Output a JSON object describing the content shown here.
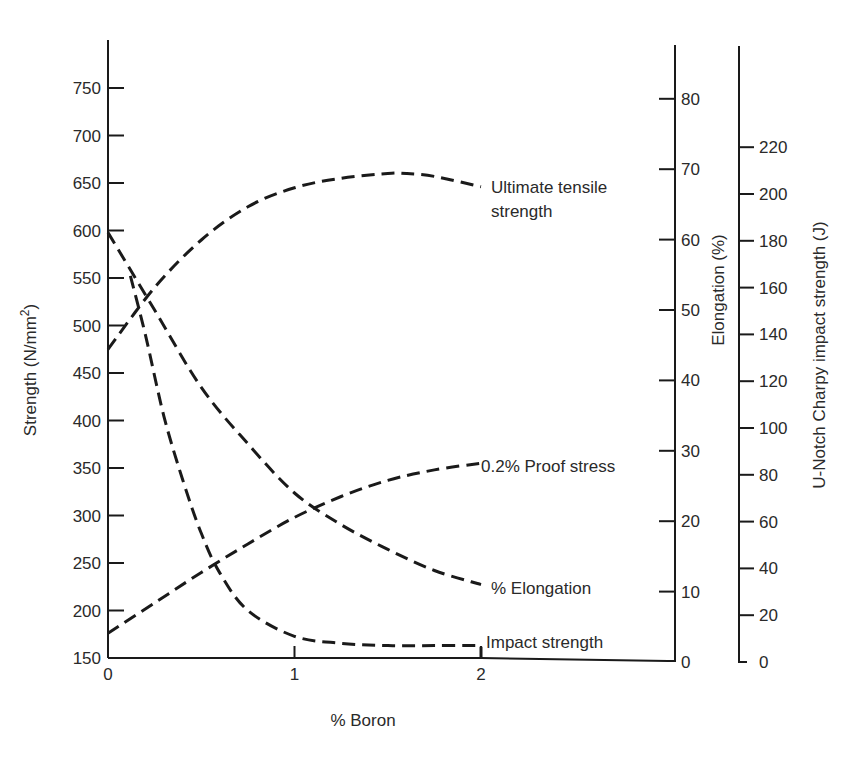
{
  "chart_data": {
    "type": "line",
    "title": "",
    "xlabel": "% Boron",
    "xlim": [
      0,
      2.9
    ],
    "x_ticks": [
      "0",
      "1",
      "2"
    ],
    "axes": {
      "left": {
        "label": "Strength (N/mm²)",
        "ylim": [
          150,
          790
        ],
        "ticks": [
          150,
          200,
          250,
          300,
          350,
          400,
          450,
          500,
          550,
          600,
          650,
          700,
          750
        ]
      },
      "right_1": {
        "label": "Elongation (%)",
        "ylim": [
          0,
          88
        ],
        "ticks": [
          0,
          10,
          20,
          30,
          40,
          50,
          60,
          70,
          80
        ]
      },
      "right_2": {
        "label": "U-Notch Charpy impact strength (J)",
        "ylim": [
          0,
          240
        ],
        "ticks": [
          0,
          20,
          40,
          60,
          80,
          100,
          120,
          140,
          160,
          180,
          200,
          220
        ]
      }
    },
    "grid": false,
    "legend_position": "inline curve labels",
    "series": [
      {
        "name": "Ultimate tensile strength",
        "axis": "left",
        "x": [
          0,
          0.25,
          0.5,
          0.75,
          1.0,
          1.25,
          1.5,
          1.6,
          1.75,
          2.0
        ],
        "values": [
          475,
          540,
          590,
          625,
          645,
          655,
          660,
          660,
          657,
          646
        ]
      },
      {
        "name": "0.2% Proof stress",
        "axis": "left",
        "x": [
          0,
          0.25,
          0.5,
          0.75,
          1.0,
          1.25,
          1.5,
          1.75,
          2.0
        ],
        "values": [
          176,
          208,
          240,
          270,
          298,
          320,
          337,
          348,
          355
        ]
      },
      {
        "name": "% Elongation",
        "axis": "right_1",
        "x": [
          0,
          0.25,
          0.5,
          0.75,
          1.0,
          1.25,
          1.5,
          1.75,
          2.0
        ],
        "values": [
          61,
          50,
          39,
          31,
          24,
          19.5,
          16,
          13,
          11
        ]
      },
      {
        "name": "Impact strength",
        "axis": "right_2",
        "x": [
          0.12,
          0.2,
          0.3,
          0.4,
          0.5,
          0.6,
          0.75,
          1.0,
          1.25,
          1.5,
          1.75,
          2.0
        ],
        "values": [
          165,
          140,
          105,
          78,
          55,
          38,
          22,
          11,
          8,
          7,
          7,
          7
        ]
      }
    ]
  },
  "labels": {
    "uts_line1": "Ultimate tensile",
    "uts_line2": "strength",
    "proof": "0.2% Proof stress",
    "elong": "% Elongation",
    "impact": "Impact strength",
    "xlabel": "% Boron",
    "left_title_main": "Strength (N/mm",
    "left_title_sup": "2",
    "left_title_end": ")",
    "elong_title": "Elongation (%)",
    "impact_title": "U-Notch Charpy impact strength (J)"
  }
}
